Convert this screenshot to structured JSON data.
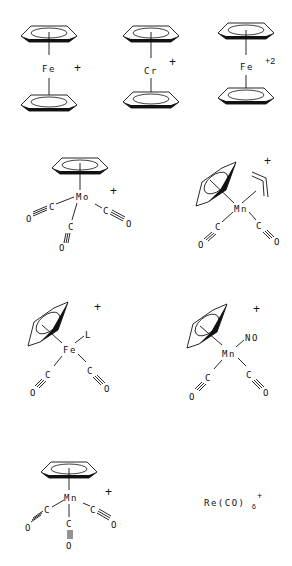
{
  "diagram": {
    "complexes": [
      {
        "id": "ferrocenium",
        "metal": "Fe",
        "charge": "+",
        "ligands": [
          "Cp",
          "Cp"
        ]
      },
      {
        "id": "chromocenium",
        "metal": "Cr",
        "charge": "+",
        "ligands": [
          "Cp",
          "Cp"
        ]
      },
      {
        "id": "ferrocene-dication",
        "metal": "Fe",
        "charge": "+2",
        "ligands": [
          "Cp",
          "Cp"
        ]
      },
      {
        "id": "cpmo-co3",
        "metal": "Mo",
        "charge": "+",
        "ligands": [
          "Cp",
          "CO",
          "CO",
          "CO"
        ]
      },
      {
        "id": "cpmn-allyl-co2",
        "metal": "Mn",
        "charge": "+",
        "ligands": [
          "Cp",
          "allyl",
          "CO",
          "CO"
        ]
      },
      {
        "id": "cpfe-l-co2",
        "metal": "Fe",
        "charge": "+",
        "ligands": [
          "Cp",
          "L",
          "CO",
          "CO"
        ],
        "extra_label": "L"
      },
      {
        "id": "cpmn-no-co2",
        "metal": "Mn",
        "charge": "+",
        "ligands": [
          "Cp",
          "NO",
          "CO",
          "CO"
        ],
        "extra_label": "NO"
      },
      {
        "id": "cpmn-co3",
        "metal": "Mn",
        "charge": "+",
        "ligands": [
          "Cp",
          "CO",
          "CO",
          "CO"
        ]
      },
      {
        "id": "re-co6",
        "formula_main": "Re(CO)",
        "formula_sub": "6",
        "formula_sup": "+"
      }
    ],
    "atoms": {
      "C": "C",
      "O": "O",
      "triple": "≡"
    }
  }
}
